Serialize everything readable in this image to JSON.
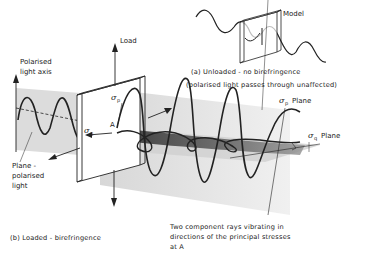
{
  "figure": {
    "panel_a": {
      "caption_line1": "(a) Unloaded - no birefringence",
      "caption_line2": "(polarised light passes through unaffected)",
      "model_label": "Model"
    },
    "panel_b": {
      "caption": "(b) Loaded - birefringence",
      "load_label": "Load",
      "axis_label_line1": "Polarised",
      "axis_label_line2": "light axis",
      "plane_label_line1": "Plane -",
      "plane_label_line2": "polarised",
      "plane_label_line3": "light",
      "sigma": "σ",
      "sigma_p_sub": "p",
      "sigma_q_sub": "q",
      "point_label": "A",
      "sigma_p_plane": "Plane",
      "sigma_q_plane": "Plane",
      "rays_line1": "Two component rays vibrating in",
      "rays_line2": "directions of the principal stresses",
      "rays_line3": "at A"
    },
    "colors": {
      "ink": "#222222",
      "plane_shade": "#d9d9d9",
      "band_shade": "#555555"
    }
  }
}
